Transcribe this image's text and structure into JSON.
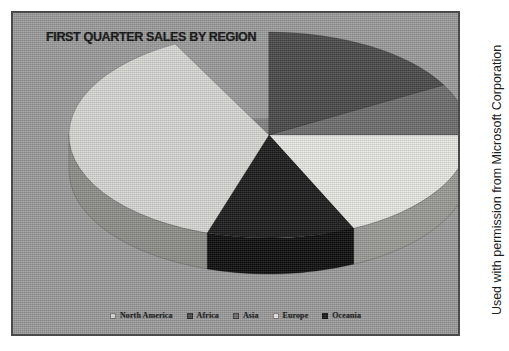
{
  "panel": {
    "background_color": "#9c9c9c",
    "border_color": "#4a4a4a"
  },
  "title": "FIRST QUARTER SALES BY REGION",
  "credit": "Used with permission from Microsoft Corporation",
  "legend": {
    "position": "bottom",
    "items": [
      {
        "label": "North America",
        "color": "#d8d8d4"
      },
      {
        "label": "Africa",
        "color": "#4a4a4a"
      },
      {
        "label": "Asia",
        "color": "#6e6e6e"
      },
      {
        "label": "Europe",
        "color": "#e8e8e4"
      },
      {
        "label": "Oceania",
        "color": "#1c1c1c"
      }
    ]
  },
  "chart_data": {
    "type": "pie",
    "title": "FIRST QUARTER SALES BY REGION",
    "subtitle": "",
    "xlabel": "",
    "ylabel": "",
    "three_d": true,
    "start_angle_deg": 0,
    "direction": "clockwise",
    "legend_position": "bottom",
    "grid": false,
    "categories": [
      "North America",
      "Africa",
      "Asia",
      "Europe",
      "Oceania"
    ],
    "values": [
      45,
      17,
      8,
      18,
      12
    ],
    "percentages": [
      45,
      17,
      8,
      18,
      12
    ],
    "colors": [
      "#d8d8d4",
      "#4a4a4a",
      "#6e6e6e",
      "#e8e8e4",
      "#1c1c1c"
    ],
    "side_colors": [
      "#8e8e8a",
      "#303030",
      "#4c4c4c",
      "#9a9a96",
      "#0d0d0d"
    ],
    "slices": [
      {
        "name": "North America",
        "value": 45,
        "start_deg": 170,
        "end_deg": 332,
        "color": "#d8d8d4"
      },
      {
        "name": "Africa",
        "value": 17,
        "start_deg": 0,
        "end_deg": 61,
        "color": "#4a4a4a"
      },
      {
        "name": "Asia",
        "value": 8,
        "start_deg": 61,
        "end_deg": 90,
        "color": "#6e6e6e"
      },
      {
        "name": "Europe",
        "value": 18,
        "start_deg": 90,
        "end_deg": 155,
        "color": "#e8e8e4"
      },
      {
        "name": "Oceania",
        "value": 12,
        "start_deg": 155,
        "end_deg": 198,
        "color": "#1c1c1c"
      }
    ]
  },
  "geometry": {
    "center_x": 256,
    "center_y": 122,
    "radius_x": 200,
    "radius_y": 103,
    "depth": 36
  }
}
